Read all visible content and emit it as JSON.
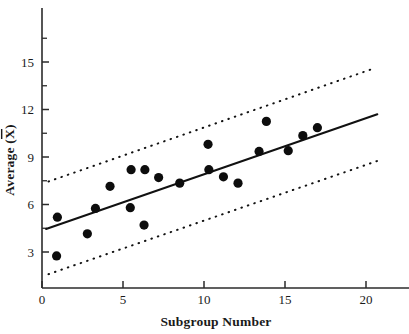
{
  "chart_data": {
    "type": "scatter",
    "title": "",
    "xlabel": "Subgroup Number",
    "ylabel": "Average (X̄)",
    "xlim": [
      0,
      22.6
    ],
    "ylim": [
      0.6,
      17.2
    ],
    "grid": false,
    "legend": null,
    "x_ticks": [
      0,
      5,
      10,
      15,
      20
    ],
    "x_tick_labels": [
      "0",
      "5",
      "10",
      "15",
      "20"
    ],
    "y_ticks": [
      3,
      6,
      9,
      12,
      15
    ],
    "y_tick_labels": [
      "3",
      "6",
      "9",
      "12",
      "15"
    ],
    "y_minor_ticks": [
      4.5,
      7.5,
      10.5,
      13.5,
      16.5
    ],
    "marker": "filled-circle",
    "marker_color": "#0d0d0d",
    "points": [
      {
        "x": 0.9,
        "y": 2.75
      },
      {
        "x": 0.95,
        "y": 5.2
      },
      {
        "x": 2.8,
        "y": 4.15
      },
      {
        "x": 3.3,
        "y": 5.75
      },
      {
        "x": 4.2,
        "y": 7.15
      },
      {
        "x": 5.45,
        "y": 5.8
      },
      {
        "x": 5.5,
        "y": 8.2
      },
      {
        "x": 6.3,
        "y": 4.7
      },
      {
        "x": 6.35,
        "y": 8.2
      },
      {
        "x": 7.2,
        "y": 7.7
      },
      {
        "x": 8.5,
        "y": 7.35
      },
      {
        "x": 10.25,
        "y": 9.8
      },
      {
        "x": 10.3,
        "y": 8.2
      },
      {
        "x": 11.2,
        "y": 7.75
      },
      {
        "x": 12.1,
        "y": 7.35
      },
      {
        "x": 13.4,
        "y": 9.35
      },
      {
        "x": 13.85,
        "y": 11.25
      },
      {
        "x": 15.2,
        "y": 9.4
      },
      {
        "x": 16.1,
        "y": 10.35
      },
      {
        "x": 17.0,
        "y": 10.85
      }
    ],
    "series": [
      {
        "name": "regression-line",
        "style": "solid",
        "x": [
          0.25,
          20.7
        ],
        "y": [
          4.45,
          11.7
        ]
      },
      {
        "name": "upper-limit-line",
        "style": "dotted",
        "x": [
          0.4,
          20.5
        ],
        "y": [
          7.45,
          14.6
        ]
      },
      {
        "name": "lower-limit-line",
        "style": "dotted",
        "x": [
          0.4,
          20.7
        ],
        "y": [
          1.6,
          8.75
        ]
      }
    ]
  },
  "axes": {
    "x_title": "Subgroup Number",
    "y_title_prefix": "Average (",
    "y_title_var": "X",
    "y_title_suffix": ")"
  }
}
